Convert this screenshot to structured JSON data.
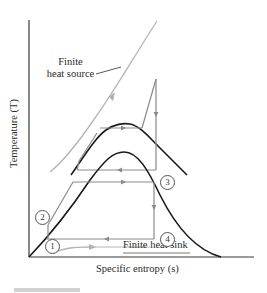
{
  "diagram": {
    "type": "T-s diagram (two-stage cycle with saturation domes)",
    "axes": {
      "x_label": "Specific entropy (s)",
      "y_label": "Temperature (T)"
    },
    "annotations": {
      "heat_source_line1": "Finite",
      "heat_source_line2": "heat source",
      "heat_sink": "Finite heat sink"
    },
    "states": [
      {
        "id": "1",
        "label": "1"
      },
      {
        "id": "2",
        "label": "2"
      },
      {
        "id": "3",
        "label": "3"
      },
      {
        "id": "4",
        "label": "4"
      }
    ],
    "colors": {
      "dome": "#1a1a1a",
      "cycle": "#8a8a8a",
      "heat_source": "#b5b5b5",
      "heat_sink": "#b5b5b5",
      "axes": "#3a3a3a"
    }
  }
}
